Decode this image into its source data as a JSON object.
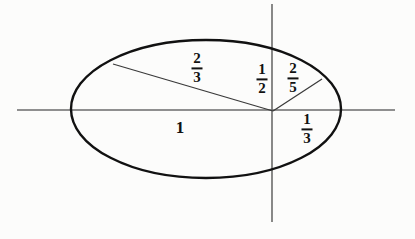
{
  "figure": {
    "type": "geometric-diagram",
    "background_color": "#fcfcfb",
    "ink_color": "#111111",
    "axis_color": "#6b6b6b",
    "chord_color": "#3a3a3a"
  },
  "geometry": {
    "canvas": {
      "width": 415,
      "height": 239
    },
    "ellipse": {
      "cx": 206,
      "cy": 109,
      "rx": 135,
      "ry": 69,
      "stroke_width": 2.4
    },
    "origin": {
      "x": 273,
      "y": 111
    },
    "x_axis": {
      "x1": 17,
      "y1": 110,
      "x2": 395,
      "y2": 110
    },
    "y_axis": {
      "x1": 272,
      "y1": 4,
      "x2": 272,
      "y2": 222
    },
    "radii": [
      {
        "name": "radius-upper-left",
        "x1": 273,
        "y1": 111,
        "x2": 113,
        "y2": 64
      },
      {
        "name": "radius-upper-right",
        "x1": 273,
        "y1": 111,
        "x2": 322,
        "y2": 79
      }
    ]
  },
  "labels": [
    {
      "id": "label-two-thirds",
      "kind": "fraction",
      "numerator": "2",
      "denominator": "3",
      "text": "2/3",
      "x": 197,
      "y": 68
    },
    {
      "id": "label-one-half",
      "kind": "fraction",
      "numerator": "1",
      "denominator": "2",
      "text": "1/2",
      "x": 262,
      "y": 79
    },
    {
      "id": "label-two-fifths",
      "kind": "fraction",
      "numerator": "2",
      "denominator": "5",
      "text": "2/5",
      "x": 293,
      "y": 78
    },
    {
      "id": "label-one-third",
      "kind": "fraction",
      "numerator": "1",
      "denominator": "3",
      "text": "1/3",
      "x": 307,
      "y": 129
    },
    {
      "id": "label-one",
      "kind": "whole",
      "value": "1",
      "text": "1",
      "x": 180,
      "y": 127
    }
  ]
}
